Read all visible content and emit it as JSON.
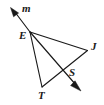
{
  "figure": {
    "background_color": "#ffffff",
    "stroke_color": "#1a1a1a",
    "width": 104,
    "height": 105
  },
  "labels": {
    "m": {
      "text": "m",
      "x": 22,
      "y": 3
    },
    "E": {
      "text": "E",
      "x": 19,
      "y": 30
    },
    "J": {
      "text": "J",
      "x": 91,
      "y": 41
    },
    "S": {
      "text": "S",
      "x": 69,
      "y": 67
    },
    "T": {
      "text": "T",
      "x": 38,
      "y": 90
    }
  },
  "points": {
    "E": {
      "x": 30,
      "y": 32
    },
    "J": {
      "x": 87,
      "y": 50
    },
    "S": {
      "x": 65,
      "y": 69
    },
    "T": {
      "x": 42,
      "y": 87
    },
    "m_tip": {
      "x": 11,
      "y": 8
    },
    "arrow_tip": {
      "x": 80,
      "y": 90
    }
  },
  "segments": [
    {
      "name": "ray-E-to-m",
      "from": "E",
      "to": "m_tip",
      "arrow": true
    },
    {
      "name": "ray-E-to-J",
      "from": "E",
      "to": "J",
      "arrow": false
    },
    {
      "name": "ray-E-through-S",
      "from": "E",
      "to": "arrow_tip",
      "arrow": true
    },
    {
      "name": "segment-E-to-T",
      "from": "E",
      "to": "T",
      "arrow": false
    },
    {
      "name": "segment-J-to-T",
      "from": "J",
      "to": "T",
      "arrow": false
    }
  ]
}
